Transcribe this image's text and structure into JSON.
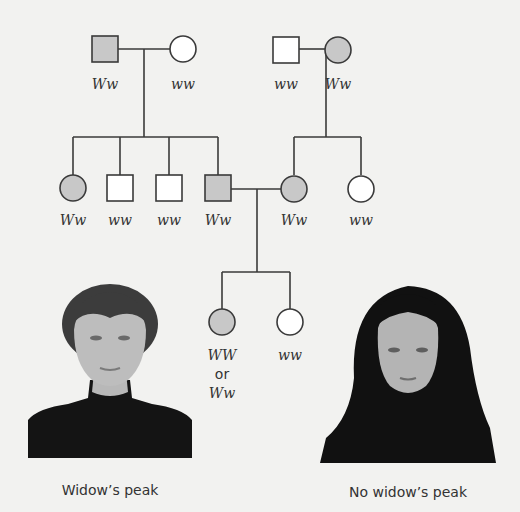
{
  "colors": {
    "affected_fill": "#c8c8c8",
    "unaffected_fill": "#ffffff",
    "stroke": "#3a3a3a",
    "background": "#f2f2f0"
  },
  "pedigree": {
    "generation_1": [
      {
        "id": "g1-male-left",
        "sex": "male",
        "affected": true,
        "genotype": "Ww"
      },
      {
        "id": "g1-female-left",
        "sex": "female",
        "affected": false,
        "genotype": "ww"
      },
      {
        "id": "g1-male-right",
        "sex": "male",
        "affected": false,
        "genotype": "ww"
      },
      {
        "id": "g1-female-right",
        "sex": "female",
        "affected": true,
        "genotype": "Ww"
      }
    ],
    "generation_2": [
      {
        "id": "g2-female-1",
        "sex": "female",
        "affected": true,
        "genotype": "Ww"
      },
      {
        "id": "g2-male-2",
        "sex": "male",
        "affected": false,
        "genotype": "ww"
      },
      {
        "id": "g2-male-3",
        "sex": "male",
        "affected": false,
        "genotype": "ww"
      },
      {
        "id": "g2-male-4",
        "sex": "male",
        "affected": true,
        "genotype": "Ww"
      },
      {
        "id": "g2-female-5",
        "sex": "female",
        "affected": true,
        "genotype": "Ww"
      },
      {
        "id": "g2-female-6",
        "sex": "female",
        "affected": false,
        "genotype": "ww"
      }
    ],
    "generation_3": [
      {
        "id": "g3-female-1",
        "sex": "female",
        "affected": true,
        "genotype_line1": "WW",
        "genotype_or": "or",
        "genotype_line2": "Ww"
      },
      {
        "id": "g3-female-2",
        "sex": "female",
        "affected": false,
        "genotype": "ww"
      }
    ]
  },
  "photos": {
    "left_caption": "Widow’s peak",
    "right_caption": "No widow’s peak"
  }
}
